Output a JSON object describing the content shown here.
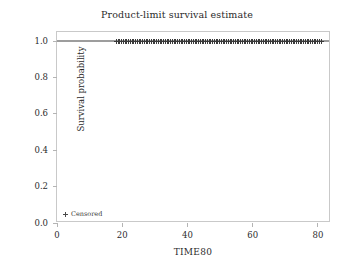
{
  "chart_data": {
    "type": "line",
    "title": "Product-limit survival estimate",
    "xlabel": "TIME80",
    "ylabel": "Survival probability",
    "xlim": [
      0,
      84
    ],
    "ylim": [
      0.0,
      1.05
    ],
    "xticks": [
      0,
      20,
      40,
      60,
      80
    ],
    "xticklabels": [
      "0",
      "20",
      "40",
      "60",
      "80"
    ],
    "yticks": [
      0.0,
      0.2,
      0.4,
      0.6,
      0.8,
      1.0
    ],
    "yticklabels": [
      "0.0",
      "0.2",
      "0.4",
      "0.6",
      "0.8",
      "1.0"
    ],
    "grid": false,
    "legend_position": "lower left",
    "series": [
      {
        "name": "Survival function",
        "style": "step",
        "color": "#3a3a3a",
        "x": [
          0,
          84
        ],
        "values": [
          1.0,
          1.0
        ]
      }
    ],
    "censored": {
      "name": "Censored",
      "marker": "plus",
      "color": "#3a3a3a",
      "survival_value": 1.0,
      "x_start": 18.2,
      "x_end": 81.0,
      "count": 118
    },
    "annotations": []
  },
  "legend": {
    "censored_label": "Censored"
  }
}
